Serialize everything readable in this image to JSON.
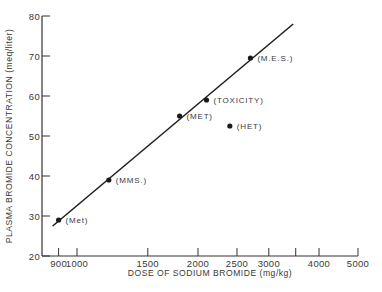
{
  "chart_data": {
    "type": "scatter",
    "title": "",
    "xlabel": "DOSE OF SODIUM BROMIDE (mg/kg)",
    "ylabel": "PLASMA BROMIDE CONCENTRATION (meq/liter)",
    "xscale": "log",
    "xlim": [
      850,
      5000
    ],
    "ylim": [
      20,
      80
    ],
    "x_ticks": [
      {
        "value": 900,
        "label": "900"
      },
      {
        "value": 1000,
        "label": "1000"
      },
      {
        "value": 1500,
        "label": "1500"
      },
      {
        "value": 2000,
        "label": "2000"
      },
      {
        "value": 2500,
        "label": "2500"
      },
      {
        "value": 3000,
        "label": "3000"
      },
      {
        "value": 3500,
        "label": ""
      },
      {
        "value": 4000,
        "label": "4000"
      },
      {
        "value": 5000,
        "label": "5000"
      }
    ],
    "y_ticks": [
      20,
      30,
      40,
      50,
      60,
      70,
      80
    ],
    "grid": false,
    "legend": null,
    "points": [
      {
        "label": "(Met)",
        "x": 900,
        "y": 29
      },
      {
        "label": "(MMS.)",
        "x": 1200,
        "y": 39
      },
      {
        "label": "(MET)",
        "x": 1800,
        "y": 55
      },
      {
        "label": "(TOXICITY)",
        "x": 2100,
        "y": 59
      },
      {
        "label": "(HET)",
        "x": 2400,
        "y": 52.5
      },
      {
        "label": "(M.E.S.)",
        "x": 2700,
        "y": 69.5
      }
    ],
    "fit_line": {
      "x_start": 870,
      "y_start": 27.5,
      "x_end": 3450,
      "y_end": 78
    }
  }
}
